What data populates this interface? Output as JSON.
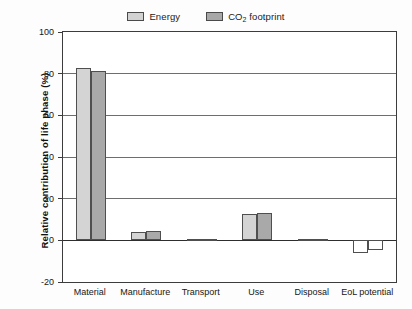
{
  "chart_data": {
    "type": "bar",
    "title": "",
    "subtitle": "",
    "xlabel": "",
    "ylabel": "Relative contribution of life phase (%)",
    "categories": [
      "Material",
      "Manufacture",
      "Transport",
      "Use",
      "Disposal",
      "EoL potential"
    ],
    "series": [
      {
        "name": "Energy",
        "color": "#d4d4d4",
        "values": [
          82.5,
          4.0,
          0.7,
          12.5,
          0.4,
          -6.0
        ]
      },
      {
        "name": "CO2 footprint",
        "color": "#a9a9a9",
        "values": [
          81.5,
          4.6,
          0.8,
          13.0,
          0.4,
          -4.5
        ]
      }
    ],
    "ylim": [
      -20,
      100
    ],
    "ytick_values": [
      100,
      80,
      60,
      40,
      20,
      0,
      -20
    ],
    "ytick_labels": [
      "100",
      "80",
      "60",
      "40",
      "20",
      "0",
      "-20"
    ],
    "grid": true,
    "grid_axis": "y",
    "legend_position": "top-center",
    "negative_bars_unfilled": true
  },
  "legend": {
    "entries": [
      {
        "label": "Energy",
        "swatch": "legend-swatch-energy"
      },
      {
        "label_prefix": "CO",
        "label_sub": "2",
        "label_suffix": " footprint",
        "swatch": "legend-swatch-co2"
      }
    ]
  }
}
